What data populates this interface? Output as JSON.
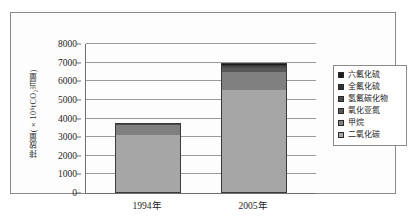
{
  "chart_data": {
    "type": "bar",
    "stacked": true,
    "title": "",
    "xlabel": "",
    "ylabel": "排放量(×10⁶tCO₂当量)",
    "categories": [
      "1994年",
      "2005年"
    ],
    "ylim": [
      0,
      8000
    ],
    "ytick_step": 1000,
    "yticks": [
      "8000",
      "7000",
      "6000",
      "5000",
      "4000",
      "3000",
      "2000",
      "1000",
      "0"
    ],
    "grid": true,
    "legend_position": "right",
    "series": [
      {
        "name": "二氧化碳",
        "values": [
          3070,
          5500
        ],
        "color": "#a6a6a6"
      },
      {
        "name": "甲烷",
        "values": [
          510,
          930
        ],
        "color": "#808080"
      },
      {
        "name": "氧化亚氮",
        "values": [
          45,
          230
        ],
        "color": "#585858"
      },
      {
        "name": "氢氟碳化物",
        "values": [
          10,
          80
        ],
        "color": "#4a4a4a"
      },
      {
        "name": "全氟化硫",
        "values": [
          8,
          70
        ],
        "color": "#333333"
      },
      {
        "name": "六氟化硫",
        "values": [
          7,
          90
        ],
        "color": "#1c1c1c"
      }
    ],
    "totals": [
      3650,
      6900
    ]
  },
  "legend": {
    "items": [
      {
        "label": "六氟化硫",
        "color": "#1c1c1c"
      },
      {
        "label": "全氟化硫",
        "color": "#333333"
      },
      {
        "label": "氢氟碳化物",
        "color": "#4a4a4a"
      },
      {
        "label": "氧化亚氮",
        "color": "#585858"
      },
      {
        "label": "甲烷",
        "color": "#808080"
      },
      {
        "label": "二氧化碳",
        "color": "#a6a6a6"
      }
    ]
  }
}
